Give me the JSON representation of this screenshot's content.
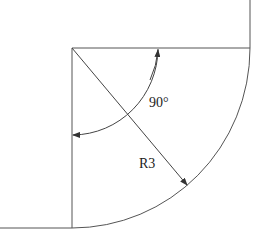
{
  "diagram": {
    "type": "technical-drawing",
    "labels": {
      "angle": "90°",
      "radius": "R3"
    },
    "colors": {
      "line": "#555555",
      "text": "#222222",
      "background": "#ffffff"
    }
  }
}
